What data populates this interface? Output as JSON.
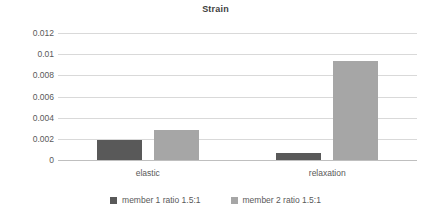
{
  "chart_data": {
    "type": "bar",
    "title": "Strain",
    "xlabel": "",
    "ylabel": "",
    "categories": [
      "elastic",
      "relaxation"
    ],
    "series": [
      {
        "name": "member 1 ratio 1.5:1",
        "color": "#595959",
        "values": [
          0.0019,
          0.00065
        ]
      },
      {
        "name": "member 2 ratio 1.5:1",
        "color": "#a6a6a6",
        "values": [
          0.0028,
          0.0094
        ]
      }
    ],
    "ylim": [
      0,
      0.012
    ],
    "yticks": [
      0,
      0.002,
      0.004,
      0.006,
      0.008,
      0.01,
      0.012
    ],
    "ytick_labels": [
      "0",
      "0.002",
      "0.004",
      "0.006",
      "0.008",
      "0.01",
      "0.012"
    ],
    "grid": true,
    "grid_axis": "y",
    "legend_position": "bottom",
    "background_color": "#ffffff",
    "gridline_color": "#d9d9d9",
    "text_color": "#595959"
  }
}
